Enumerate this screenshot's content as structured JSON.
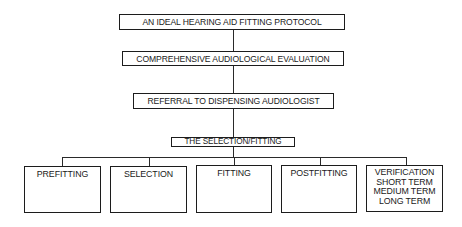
{
  "diagram": {
    "type": "hierarchy flowchart",
    "nodes": {
      "title": "AN IDEAL HEARING AID FITTING PROTOCOL",
      "evaluation": "COMPREHENSIVE AUDIOLOGICAL EVALUATION",
      "referral": "REFERRAL TO DISPENSING AUDIOLOGIST",
      "selection_fitting": "THE SELECTION/FITTING",
      "children": [
        {
          "label": "PREFITTING"
        },
        {
          "label": "SELECTION"
        },
        {
          "label": "FITTING"
        },
        {
          "label": "POSTFITTING"
        },
        {
          "label": "VERIFICATION",
          "sublines": [
            "SHORT TERM",
            "MEDIUM TERM",
            "LONG TERM"
          ]
        }
      ]
    },
    "edges": [
      [
        "title",
        "evaluation"
      ],
      [
        "evaluation",
        "referral"
      ],
      [
        "referral",
        "selection_fitting"
      ],
      [
        "selection_fitting",
        "PREFITTING"
      ],
      [
        "selection_fitting",
        "SELECTION"
      ],
      [
        "selection_fitting",
        "FITTING"
      ],
      [
        "selection_fitting",
        "POSTFITTING"
      ],
      [
        "selection_fitting",
        "VERIFICATION"
      ]
    ],
    "colors": {
      "line": "#1c1c1c",
      "background": "#ffffff"
    }
  }
}
